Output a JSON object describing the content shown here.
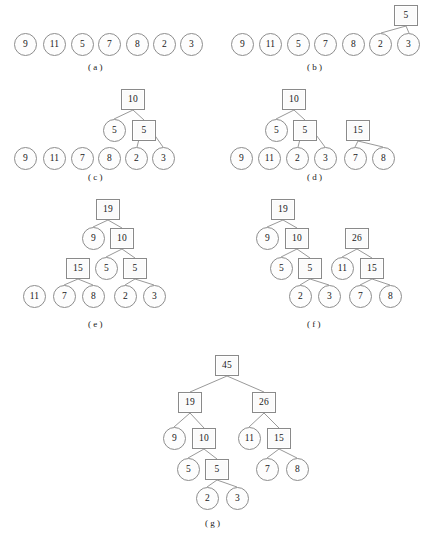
{
  "figure": {
    "node_shapes": {
      "leaf": "circle",
      "internal": "square"
    },
    "panels": [
      {
        "id": "a",
        "label": "( a )",
        "label_x": 88,
        "label_y": 62,
        "origin_x": 0,
        "origin_y": 0,
        "nodes": [
          {
            "name": "a-leaf-9",
            "value": "9",
            "shape": "circle",
            "x": 14,
            "y": 33
          },
          {
            "name": "a-leaf-11",
            "value": "11",
            "shape": "circle",
            "x": 43,
            "y": 33
          },
          {
            "name": "a-leaf-5",
            "value": "5",
            "shape": "circle",
            "x": 71,
            "y": 33
          },
          {
            "name": "a-leaf-7",
            "value": "7",
            "shape": "circle",
            "x": 98,
            "y": 33
          },
          {
            "name": "a-leaf-8",
            "value": "8",
            "shape": "circle",
            "x": 126,
            "y": 33
          },
          {
            "name": "a-leaf-2",
            "value": "2",
            "shape": "circle",
            "x": 153,
            "y": 33
          },
          {
            "name": "a-leaf-3",
            "value": "3",
            "shape": "circle",
            "x": 180,
            "y": 33
          }
        ],
        "edges": []
      },
      {
        "id": "b",
        "label": "( b )",
        "label_x": 307,
        "label_y": 62,
        "origin_x": 0,
        "origin_y": 0,
        "nodes": [
          {
            "name": "b-leaf-9",
            "value": "9",
            "shape": "circle",
            "x": 231,
            "y": 33
          },
          {
            "name": "b-leaf-11",
            "value": "11",
            "shape": "circle",
            "x": 259,
            "y": 33
          },
          {
            "name": "b-leaf-5",
            "value": "5",
            "shape": "circle",
            "x": 287,
            "y": 33
          },
          {
            "name": "b-leaf-7",
            "value": "7",
            "shape": "circle",
            "x": 314,
            "y": 33
          },
          {
            "name": "b-leaf-8",
            "value": "8",
            "shape": "circle",
            "x": 342,
            "y": 33
          },
          {
            "name": "b-leaf-2",
            "value": "2",
            "shape": "circle",
            "x": 369,
            "y": 33
          },
          {
            "name": "b-leaf-3",
            "value": "3",
            "shape": "circle",
            "x": 397,
            "y": 33
          },
          {
            "name": "b-internal-5",
            "value": "5",
            "shape": "square",
            "x": 394,
            "y": 5
          }
        ],
        "edges": [
          {
            "x1": 406,
            "y1": 26,
            "x2": 381,
            "y2": 33
          },
          {
            "x1": 406,
            "y1": 26,
            "x2": 409,
            "y2": 33
          }
        ]
      },
      {
        "id": "c",
        "label": "( c )",
        "label_x": 88,
        "label_y": 172,
        "origin_x": 0,
        "origin_y": 0,
        "nodes": [
          {
            "name": "c-leaf-9",
            "value": "9",
            "shape": "circle",
            "x": 14,
            "y": 147
          },
          {
            "name": "c-leaf-11",
            "value": "11",
            "shape": "circle",
            "x": 43,
            "y": 147
          },
          {
            "name": "c-leaf-7",
            "value": "7",
            "shape": "circle",
            "x": 71,
            "y": 147
          },
          {
            "name": "c-leaf-8",
            "value": "8",
            "shape": "circle",
            "x": 98,
            "y": 147
          },
          {
            "name": "c-leaf-2",
            "value": "2",
            "shape": "circle",
            "x": 125,
            "y": 147
          },
          {
            "name": "c-leaf-3",
            "value": "3",
            "shape": "circle",
            "x": 152,
            "y": 147
          },
          {
            "name": "c-leaf-5",
            "value": "5",
            "shape": "circle",
            "x": 103,
            "y": 119
          },
          {
            "name": "c-internal-5",
            "value": "5",
            "shape": "square",
            "x": 132,
            "y": 120
          },
          {
            "name": "c-internal-10",
            "value": "10",
            "shape": "square",
            "x": 121,
            "y": 89
          }
        ],
        "edges": [
          {
            "x1": 144,
            "y1": 120,
            "x2": 137,
            "y2": 147
          },
          {
            "x1": 144,
            "y1": 120,
            "x2": 163,
            "y2": 147
          },
          {
            "x1": 133,
            "y1": 110,
            "x2": 114,
            "y2": 119
          },
          {
            "x1": 133,
            "y1": 110,
            "x2": 144,
            "y2": 120
          }
        ]
      },
      {
        "id": "d",
        "label": "( d )",
        "label_x": 307,
        "label_y": 172,
        "origin_x": 0,
        "origin_y": 0,
        "nodes": [
          {
            "name": "d-leaf-9",
            "value": "9",
            "shape": "circle",
            "x": 230,
            "y": 147
          },
          {
            "name": "d-leaf-11",
            "value": "11",
            "shape": "circle",
            "x": 258,
            "y": 147
          },
          {
            "name": "d-leaf-2",
            "value": "2",
            "shape": "circle",
            "x": 286,
            "y": 147
          },
          {
            "name": "d-leaf-3",
            "value": "3",
            "shape": "circle",
            "x": 314,
            "y": 147
          },
          {
            "name": "d-leaf-7",
            "value": "7",
            "shape": "circle",
            "x": 344,
            "y": 147
          },
          {
            "name": "d-leaf-8",
            "value": "8",
            "shape": "circle",
            "x": 372,
            "y": 147
          },
          {
            "name": "d-leaf-5",
            "value": "5",
            "shape": "circle",
            "x": 265,
            "y": 119
          },
          {
            "name": "d-internal-5",
            "value": "5",
            "shape": "square",
            "x": 293,
            "y": 120
          },
          {
            "name": "d-internal-10",
            "value": "10",
            "shape": "square",
            "x": 282,
            "y": 89
          },
          {
            "name": "d-internal-15",
            "value": "15",
            "shape": "square",
            "x": 346,
            "y": 120
          }
        ],
        "edges": [
          {
            "x1": 305,
            "y1": 120,
            "x2": 298,
            "y2": 147
          },
          {
            "x1": 305,
            "y1": 120,
            "x2": 325,
            "y2": 147
          },
          {
            "x1": 294,
            "y1": 110,
            "x2": 276,
            "y2": 119
          },
          {
            "x1": 294,
            "y1": 110,
            "x2": 305,
            "y2": 120
          },
          {
            "x1": 358,
            "y1": 141,
            "x2": 355,
            "y2": 147
          },
          {
            "x1": 358,
            "y1": 141,
            "x2": 383,
            "y2": 147
          }
        ]
      },
      {
        "id": "e",
        "label": "( e )",
        "label_x": 88,
        "label_y": 319,
        "origin_x": 0,
        "origin_y": 0,
        "nodes": [
          {
            "name": "e-leaf-11",
            "value": "11",
            "shape": "circle",
            "x": 23,
            "y": 285
          },
          {
            "name": "e-leaf-7",
            "value": "7",
            "shape": "circle",
            "x": 53,
            "y": 285
          },
          {
            "name": "e-leaf-8",
            "value": "8",
            "shape": "circle",
            "x": 82,
            "y": 285
          },
          {
            "name": "e-leaf-2",
            "value": "2",
            "shape": "circle",
            "x": 114,
            "y": 285
          },
          {
            "name": "e-leaf-3",
            "value": "3",
            "shape": "circle",
            "x": 143,
            "y": 285
          },
          {
            "name": "e-internal-15",
            "value": "15",
            "shape": "square",
            "x": 66,
            "y": 258
          },
          {
            "name": "e-leaf-5",
            "value": "5",
            "shape": "circle",
            "x": 95,
            "y": 257
          },
          {
            "name": "e-internal-5",
            "value": "5",
            "shape": "square",
            "x": 123,
            "y": 258
          },
          {
            "name": "e-internal-10",
            "value": "10",
            "shape": "square",
            "x": 110,
            "y": 228
          },
          {
            "name": "e-leaf-9",
            "value": "9",
            "shape": "circle",
            "x": 82,
            "y": 227
          },
          {
            "name": "e-internal-19",
            "value": "19",
            "shape": "square",
            "x": 96,
            "y": 199
          }
        ],
        "edges": [
          {
            "x1": 78,
            "y1": 279,
            "x2": 64,
            "y2": 285
          },
          {
            "x1": 78,
            "y1": 279,
            "x2": 93,
            "y2": 285
          },
          {
            "x1": 135,
            "y1": 279,
            "x2": 125,
            "y2": 285
          },
          {
            "x1": 135,
            "y1": 279,
            "x2": 154,
            "y2": 285
          },
          {
            "x1": 122,
            "y1": 249,
            "x2": 106,
            "y2": 257
          },
          {
            "x1": 122,
            "y1": 249,
            "x2": 135,
            "y2": 258
          },
          {
            "x1": 108,
            "y1": 220,
            "x2": 93,
            "y2": 227
          },
          {
            "x1": 108,
            "y1": 220,
            "x2": 122,
            "y2": 228
          }
        ]
      },
      {
        "id": "f",
        "label": "( f )",
        "label_x": 307,
        "label_y": 319,
        "origin_x": 0,
        "origin_y": 0,
        "nodes": [
          {
            "name": "f-leaf-2",
            "value": "2",
            "shape": "circle",
            "x": 289,
            "y": 285
          },
          {
            "name": "f-leaf-3",
            "value": "3",
            "shape": "circle",
            "x": 318,
            "y": 285
          },
          {
            "name": "f-leaf-7",
            "value": "7",
            "shape": "circle",
            "x": 349,
            "y": 285
          },
          {
            "name": "f-leaf-8",
            "value": "8",
            "shape": "circle",
            "x": 379,
            "y": 285
          },
          {
            "name": "f-leaf-5",
            "value": "5",
            "shape": "circle",
            "x": 270,
            "y": 257
          },
          {
            "name": "f-internal-5",
            "value": "5",
            "shape": "square",
            "x": 298,
            "y": 258
          },
          {
            "name": "f-leaf-11",
            "value": "11",
            "shape": "circle",
            "x": 331,
            "y": 257
          },
          {
            "name": "f-internal-15",
            "value": "15",
            "shape": "square",
            "x": 360,
            "y": 258
          },
          {
            "name": "f-leaf-9",
            "value": "9",
            "shape": "circle",
            "x": 256,
            "y": 227
          },
          {
            "name": "f-internal-10",
            "value": "10",
            "shape": "square",
            "x": 285,
            "y": 228
          },
          {
            "name": "f-internal-26",
            "value": "26",
            "shape": "square",
            "x": 345,
            "y": 228
          },
          {
            "name": "f-internal-19",
            "value": "19",
            "shape": "square",
            "x": 271,
            "y": 199
          }
        ],
        "edges": [
          {
            "x1": 310,
            "y1": 279,
            "x2": 300,
            "y2": 285
          },
          {
            "x1": 310,
            "y1": 279,
            "x2": 329,
            "y2": 285
          },
          {
            "x1": 372,
            "y1": 279,
            "x2": 360,
            "y2": 285
          },
          {
            "x1": 372,
            "y1": 279,
            "x2": 390,
            "y2": 285
          },
          {
            "x1": 297,
            "y1": 249,
            "x2": 281,
            "y2": 257
          },
          {
            "x1": 297,
            "y1": 249,
            "x2": 310,
            "y2": 258
          },
          {
            "x1": 357,
            "y1": 249,
            "x2": 342,
            "y2": 257
          },
          {
            "x1": 357,
            "y1": 249,
            "x2": 372,
            "y2": 258
          },
          {
            "x1": 283,
            "y1": 220,
            "x2": 267,
            "y2": 227
          },
          {
            "x1": 283,
            "y1": 220,
            "x2": 297,
            "y2": 228
          }
        ]
      },
      {
        "id": "g",
        "label": "( g )",
        "label_x": 205,
        "label_y": 518,
        "origin_x": 0,
        "origin_y": 0,
        "nodes": [
          {
            "name": "g-leaf-2",
            "value": "2",
            "shape": "circle",
            "x": 196,
            "y": 487
          },
          {
            "name": "g-leaf-3",
            "value": "3",
            "shape": "circle",
            "x": 226,
            "y": 487
          },
          {
            "name": "g-leaf-5",
            "value": "5",
            "shape": "circle",
            "x": 177,
            "y": 458
          },
          {
            "name": "g-internal-5",
            "value": "5",
            "shape": "square",
            "x": 205,
            "y": 459
          },
          {
            "name": "g-leaf-7",
            "value": "7",
            "shape": "circle",
            "x": 256,
            "y": 458
          },
          {
            "name": "g-leaf-8",
            "value": "8",
            "shape": "circle",
            "x": 286,
            "y": 458
          },
          {
            "name": "g-leaf-9",
            "value": "9",
            "shape": "circle",
            "x": 163,
            "y": 427
          },
          {
            "name": "g-internal-10",
            "value": "10",
            "shape": "square",
            "x": 192,
            "y": 428
          },
          {
            "name": "g-leaf-11",
            "value": "11",
            "shape": "circle",
            "x": 238,
            "y": 427
          },
          {
            "name": "g-internal-15",
            "value": "15",
            "shape": "square",
            "x": 267,
            "y": 428
          },
          {
            "name": "g-internal-19",
            "value": "19",
            "shape": "square",
            "x": 178,
            "y": 392
          },
          {
            "name": "g-internal-26",
            "value": "26",
            "shape": "square",
            "x": 252,
            "y": 392
          },
          {
            "name": "g-internal-45",
            "value": "45",
            "shape": "square",
            "x": 215,
            "y": 355
          }
        ],
        "edges": [
          {
            "x1": 217,
            "y1": 480,
            "x2": 207,
            "y2": 487
          },
          {
            "x1": 217,
            "y1": 480,
            "x2": 237,
            "y2": 487
          },
          {
            "x1": 204,
            "y1": 449,
            "x2": 188,
            "y2": 458
          },
          {
            "x1": 204,
            "y1": 449,
            "x2": 217,
            "y2": 459
          },
          {
            "x1": 279,
            "y1": 449,
            "x2": 267,
            "y2": 458
          },
          {
            "x1": 279,
            "y1": 449,
            "x2": 297,
            "y2": 458
          },
          {
            "x1": 190,
            "y1": 413,
            "x2": 174,
            "y2": 427
          },
          {
            "x1": 190,
            "y1": 413,
            "x2": 204,
            "y2": 428
          },
          {
            "x1": 264,
            "y1": 413,
            "x2": 249,
            "y2": 427
          },
          {
            "x1": 264,
            "y1": 413,
            "x2": 279,
            "y2": 428
          },
          {
            "x1": 227,
            "y1": 376,
            "x2": 190,
            "y2": 392
          },
          {
            "x1": 227,
            "y1": 376,
            "x2": 264,
            "y2": 392
          }
        ]
      }
    ]
  }
}
